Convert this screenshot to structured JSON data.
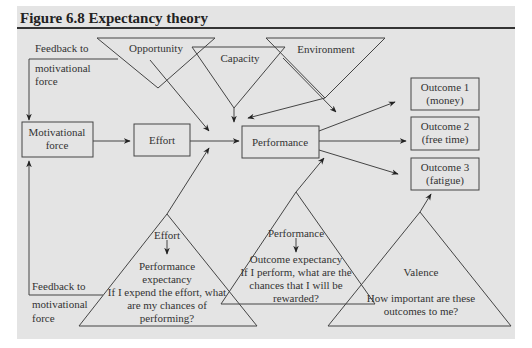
{
  "figure": {
    "title": "Figure 6.8 Expectancy theory"
  },
  "top_triangles": {
    "opportunity": "Opportunity",
    "capacity": "Capacity",
    "environment": "Environment"
  },
  "feedback_top": [
    "Feedback to",
    "motivational",
    "force"
  ],
  "feedback_bottom": [
    "Feedback to",
    "motivational",
    "force"
  ],
  "boxes": {
    "motivational_force": [
      "Motivational",
      "force"
    ],
    "effort": "Effort",
    "performance": "Performance",
    "outcome1": [
      "Outcome 1",
      "(money)"
    ],
    "outcome2": [
      "Outcome 2",
      "(free time)"
    ],
    "outcome3": [
      "Outcome 3",
      "(fatigue)"
    ]
  },
  "triangle_effort": {
    "top": "Effort",
    "lines": [
      "Performance",
      "expectancy",
      "If I expend the effort, what",
      "are my chances of",
      "performing?"
    ]
  },
  "triangle_performance": {
    "top": "Performance",
    "lines": [
      "Outcome expectancy",
      "If I perform, what are the",
      "chances that I will be",
      "rewarded?"
    ]
  },
  "triangle_valence": {
    "title": "Valence",
    "lines": [
      "How important are these",
      "outcomes to me?"
    ]
  }
}
